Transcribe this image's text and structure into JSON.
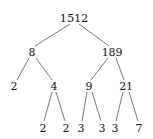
{
  "figure": {
    "width": 153,
    "height": 139,
    "background_color": "#ffffff",
    "text_color": "#111111",
    "edge_color": "#555555",
    "top_clipped_text": "— ——— — — — — — — —"
  },
  "chart_data": {
    "type": "diagram",
    "diagram_type": "factor-tree",
    "root_value": "1512",
    "prime_factorization": "2 x 2 x 2 x 3 x 3 x 3 x 7",
    "levels": [
      [
        "1512"
      ],
      [
        "8",
        "189"
      ],
      [
        "2",
        "4",
        "9",
        "21"
      ],
      [
        "2",
        "2",
        "3",
        "3",
        "3",
        "7"
      ]
    ],
    "nodes": [
      {
        "id": "n1512",
        "label": "1512",
        "x": 74,
        "y": 18,
        "level": 0,
        "prime": false
      },
      {
        "id": "n8",
        "label": "8",
        "x": 32,
        "y": 52,
        "level": 1,
        "prime": false
      },
      {
        "id": "n189",
        "label": "189",
        "x": 112,
        "y": 52,
        "level": 1,
        "prime": false
      },
      {
        "id": "n2a",
        "label": "2",
        "x": 14,
        "y": 86,
        "level": 2,
        "prime": true
      },
      {
        "id": "n4",
        "label": "4",
        "x": 54,
        "y": 86,
        "level": 2,
        "prime": false
      },
      {
        "id": "n9",
        "label": "9",
        "x": 89,
        "y": 86,
        "level": 2,
        "prime": false
      },
      {
        "id": "n21",
        "label": "21",
        "x": 126,
        "y": 86,
        "level": 2,
        "prime": false
      },
      {
        "id": "n2b",
        "label": "2",
        "x": 43,
        "y": 128,
        "level": 3,
        "prime": true
      },
      {
        "id": "n2c",
        "label": "2",
        "x": 66,
        "y": 128,
        "level": 3,
        "prime": true
      },
      {
        "id": "n3a",
        "label": "3",
        "x": 81,
        "y": 128,
        "level": 3,
        "prime": true
      },
      {
        "id": "n3b",
        "label": "3",
        "x": 102,
        "y": 128,
        "level": 3,
        "prime": true
      },
      {
        "id": "n3c",
        "label": "3",
        "x": 115,
        "y": 128,
        "level": 3,
        "prime": true
      },
      {
        "id": "n7",
        "label": "7",
        "x": 139,
        "y": 128,
        "level": 3,
        "prime": true
      }
    ],
    "edges": [
      {
        "from": "n1512",
        "to": "n8",
        "x1": 70,
        "y1": 24,
        "x2": 35,
        "y2": 46
      },
      {
        "from": "n1512",
        "to": "n189",
        "x1": 79,
        "y1": 24,
        "x2": 109,
        "y2": 46
      },
      {
        "from": "n8",
        "to": "n2a",
        "x1": 29,
        "y1": 58,
        "x2": 17,
        "y2": 80
      },
      {
        "from": "n8",
        "to": "n4",
        "x1": 36,
        "y1": 58,
        "x2": 52,
        "y2": 80
      },
      {
        "from": "n189",
        "to": "n9",
        "x1": 108,
        "y1": 58,
        "x2": 91,
        "y2": 80
      },
      {
        "from": "n189",
        "to": "n21",
        "x1": 116,
        "y1": 58,
        "x2": 124,
        "y2": 80
      },
      {
        "from": "n4",
        "to": "n2b",
        "x1": 52,
        "y1": 92,
        "x2": 44,
        "y2": 121
      },
      {
        "from": "n4",
        "to": "n2c",
        "x1": 56,
        "y1": 92,
        "x2": 65,
        "y2": 121
      },
      {
        "from": "n9",
        "to": "n3a",
        "x1": 87,
        "y1": 92,
        "x2": 82,
        "y2": 121
      },
      {
        "from": "n9",
        "to": "n3b",
        "x1": 92,
        "y1": 92,
        "x2": 101,
        "y2": 121
      },
      {
        "from": "n21",
        "to": "n3c",
        "x1": 123,
        "y1": 92,
        "x2": 116,
        "y2": 121
      },
      {
        "from": "n21",
        "to": "n7",
        "x1": 129,
        "y1": 92,
        "x2": 138,
        "y2": 121
      }
    ]
  }
}
